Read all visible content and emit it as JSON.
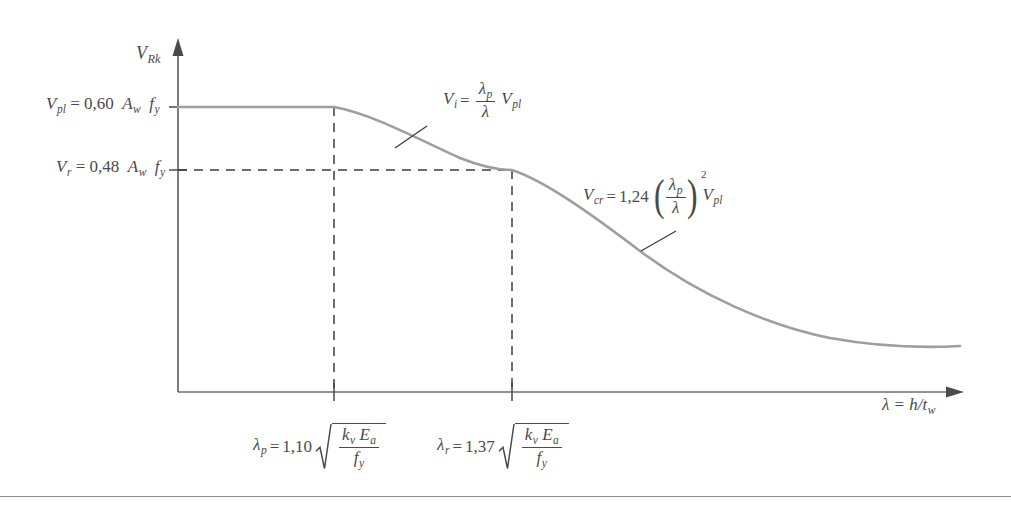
{
  "figure": {
    "type": "engineering-diagram",
    "axes": {
      "y_axis_label": "V",
      "y_axis_label_sub": "Rk",
      "x_axis_label": "λ = h/t",
      "x_axis_label_sub": "w",
      "x_axis_origin_px": 178,
      "x_axis_end_px": 962,
      "y_axis_top_px": 42,
      "y_axis_baseline_px": 392
    },
    "levels": [
      {
        "name": "V-pl-level",
        "symbol": "V",
        "symbol_sub": "pl",
        "coefficient": "0,60",
        "expression": "A",
        "expression_sub": "w",
        "expression2": "f",
        "expression2_sub": "y",
        "full_text": "V_pl = 0,60 A_w f_y",
        "y_px": 107,
        "line_style": "solid"
      },
      {
        "name": "V-r-level",
        "symbol": "V",
        "symbol_sub": "r",
        "coefficient": "0,48",
        "expression": "A",
        "expression_sub": "w",
        "expression2": "f",
        "expression2_sub": "y",
        "full_text": "V_r = 0,48 A_w f_y",
        "y_px": 170,
        "line_style": "dashed"
      }
    ],
    "x_ticks": [
      {
        "name": "lambda-p",
        "symbol": "λ",
        "symbol_sub": "p",
        "coefficient": "1,10",
        "radicand_num_1": "k",
        "radicand_num_1_sub": "v",
        "radicand_num_2": "E",
        "radicand_num_2_sub": "a",
        "radicand_den": "f",
        "radicand_den_sub": "y",
        "full_text": "λ_p = 1,10 √(k_v E_a / f_y)",
        "x_px": 334
      },
      {
        "name": "lambda-r",
        "symbol": "λ",
        "symbol_sub": "r",
        "coefficient": "1,37",
        "radicand_num_1": "k",
        "radicand_num_1_sub": "v",
        "radicand_num_2": "E",
        "radicand_num_2_sub": "a",
        "radicand_den": "f",
        "radicand_den_sub": "y",
        "full_text": "λ_r = 1,37 √(k_v E_a / f_y)",
        "x_px": 512
      }
    ],
    "annotations": [
      {
        "name": "V-i-formula",
        "symbol": "V",
        "symbol_sub": "i",
        "eq": "=",
        "frac_num": "λ",
        "frac_num_sub": "p",
        "frac_den": "λ",
        "tail": "V",
        "tail_sub": "pl",
        "full_text": "V_i = (λ_p / λ) V_pl",
        "leader_from": [
          395,
          148
        ],
        "leader_to": [
          427,
          126
        ]
      },
      {
        "name": "V-cr-formula",
        "symbol": "V",
        "symbol_sub": "cr",
        "eq": "=",
        "coefficient": "1,24",
        "frac_num": "λ",
        "frac_num_sub": "p",
        "frac_den": "λ",
        "exponent": "2",
        "tail": "V",
        "tail_sub": "pl",
        "full_text": "V_cr = 1,24 (λ_p / λ)² V_pl",
        "leader_from": [
          641,
          251
        ],
        "leader_to": [
          676,
          231
        ]
      }
    ],
    "curve": {
      "name": "resistance-curve",
      "description": "Plateau at V_pl up to lambda_p, inelastic branch down to V_r at lambda_r, then elastic buckling branch decaying toward the axis",
      "color": "#9e9e9e",
      "segments": [
        {
          "region": "plateau",
          "from_x": 178,
          "to_x": 334,
          "y": 107
        },
        {
          "region": "inelastic",
          "from": [
            334,
            107
          ],
          "to": [
            512,
            170
          ]
        },
        {
          "region": "elastic",
          "from": [
            512,
            170
          ],
          "to": [
            962,
            346
          ]
        }
      ]
    },
    "colors": {
      "curve": "#9e9e9e",
      "axis": "#6e6e6e",
      "dashed": "#3c3c3c",
      "text": "#4a4a4a",
      "rule": "#8c8c8c"
    }
  }
}
